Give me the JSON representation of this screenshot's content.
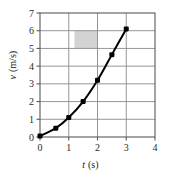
{
  "chart_data": {
    "type": "line",
    "title": "",
    "xlabel": "t (s)",
    "ylabel": "v (m/s)",
    "xlabel_symbol": "t",
    "xlabel_unit": "(s)",
    "ylabel_symbol": "v",
    "ylabel_unit": "(m/s)",
    "xlim": [
      0,
      4
    ],
    "ylim": [
      0,
      7
    ],
    "xticks": [
      0,
      1,
      2,
      3,
      4
    ],
    "yticks": [
      0,
      1,
      2,
      3,
      4,
      5,
      6,
      7
    ],
    "xtick_labels": [
      "0",
      "1",
      "2",
      "3",
      "4"
    ],
    "ytick_labels": [
      "0",
      "1",
      "2",
      "3",
      "4",
      "5",
      "6",
      "7"
    ],
    "grid": true,
    "grid_color": "#888888",
    "legend": "none",
    "series": [
      {
        "name": "velocity",
        "marker": "filled-square",
        "color": "#000000",
        "x": [
          0.0,
          0.55,
          1.0,
          1.5,
          2.0,
          2.5,
          3.0
        ],
        "y": [
          0.05,
          0.5,
          1.1,
          2.0,
          3.2,
          4.65,
          6.1
        ]
      }
    ],
    "annotations": [
      {
        "kind": "shaded-rectangle",
        "color": "#d3d3d3",
        "x0": 1.2,
        "x1": 2.0,
        "y0": 5.0,
        "y1": 6.0
      }
    ]
  },
  "accent_colors": {
    "curve": "#000000",
    "frame": "#555555",
    "gridlines": "#888888",
    "shading": "#d3d3d3",
    "background": "#ffffff"
  }
}
